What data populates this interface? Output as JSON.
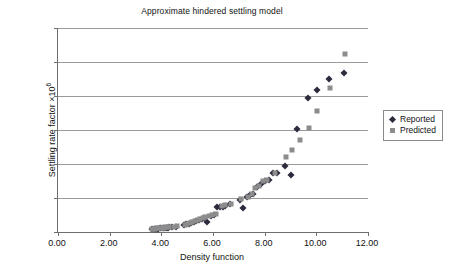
{
  "chart_data": {
    "type": "scatter",
    "title": "Approximate hindered settling model",
    "xlabel": "Density function",
    "ylabel": "Settling rate factor ×10⁶",
    "ylabel_base": "Settling rate factor ×10",
    "ylabel_exponent": "6",
    "xlim": [
      0.0,
      12.0
    ],
    "ylim": [
      0,
      12
    ],
    "xticks": [
      "0.00",
      "2.00",
      "4.00",
      "6.00",
      "8.00",
      "10.00",
      "12.00"
    ],
    "xtick_values": [
      0,
      2,
      4,
      6,
      8,
      10,
      12
    ],
    "yticks": [
      "0",
      "2",
      "4",
      "6",
      "8",
      "10",
      "12"
    ],
    "ytick_values": [
      0,
      2,
      4,
      6,
      8,
      10,
      12
    ],
    "grid": "horizontal",
    "legend_position": "right",
    "legend": [
      "Reported",
      "Predicted"
    ],
    "colors": {
      "reported": "#2b2b3d",
      "predicted": "#8c8c8c",
      "gridline": "#9a9a9a",
      "axis": "#6e6e6e"
    },
    "series": [
      {
        "name": "Reported",
        "marker": "diamond",
        "color": "#2b2b3d",
        "points": [
          [
            3.62,
            0.16
          ],
          [
            3.7,
            0.17
          ],
          [
            3.76,
            0.18
          ],
          [
            3.82,
            0.19
          ],
          [
            3.88,
            0.2
          ],
          [
            3.94,
            0.21
          ],
          [
            4.0,
            0.22
          ],
          [
            4.06,
            0.23
          ],
          [
            4.12,
            0.24
          ],
          [
            4.18,
            0.25
          ],
          [
            4.24,
            0.26
          ],
          [
            4.3,
            0.27
          ],
          [
            4.42,
            0.29
          ],
          [
            4.56,
            0.31
          ],
          [
            4.86,
            0.4
          ],
          [
            4.96,
            0.45
          ],
          [
            5.06,
            0.5
          ],
          [
            5.16,
            0.55
          ],
          [
            5.26,
            0.6
          ],
          [
            5.36,
            0.66
          ],
          [
            5.46,
            0.72
          ],
          [
            5.56,
            0.78
          ],
          [
            5.66,
            0.84
          ],
          [
            5.78,
            0.6
          ],
          [
            5.92,
            0.92
          ],
          [
            6.04,
            1.02
          ],
          [
            6.16,
            1.45
          ],
          [
            6.26,
            1.48
          ],
          [
            6.38,
            1.5
          ],
          [
            6.48,
            1.52
          ],
          [
            6.66,
            1.62
          ],
          [
            7.06,
            1.88
          ],
          [
            7.18,
            1.42
          ],
          [
            7.3,
            2.04
          ],
          [
            7.44,
            2.18
          ],
          [
            7.56,
            2.22
          ],
          [
            7.72,
            2.66
          ],
          [
            7.86,
            2.82
          ],
          [
            8.02,
            3.02
          ],
          [
            8.16,
            3.06
          ],
          [
            8.34,
            3.48
          ],
          [
            8.46,
            3.5
          ],
          [
            8.8,
            3.9
          ],
          [
            9.0,
            3.36
          ],
          [
            9.24,
            6.08
          ],
          [
            9.66,
            7.88
          ],
          [
            10.02,
            8.36
          ],
          [
            10.48,
            9.0
          ],
          [
            11.08,
            9.35
          ]
        ]
      },
      {
        "name": "Predicted",
        "marker": "square",
        "color": "#8c8c8c",
        "points": [
          [
            3.62,
            0.18
          ],
          [
            3.7,
            0.19
          ],
          [
            3.76,
            0.2
          ],
          [
            3.82,
            0.21
          ],
          [
            3.88,
            0.22
          ],
          [
            3.94,
            0.23
          ],
          [
            4.0,
            0.24
          ],
          [
            4.06,
            0.25
          ],
          [
            4.12,
            0.26
          ],
          [
            4.18,
            0.27
          ],
          [
            4.24,
            0.28
          ],
          [
            4.3,
            0.29
          ],
          [
            4.48,
            0.32
          ],
          [
            4.62,
            0.34
          ],
          [
            4.9,
            0.44
          ],
          [
            5.0,
            0.5
          ],
          [
            5.1,
            0.55
          ],
          [
            5.2,
            0.6
          ],
          [
            5.3,
            0.66
          ],
          [
            5.4,
            0.72
          ],
          [
            5.5,
            0.78
          ],
          [
            5.6,
            0.84
          ],
          [
            5.7,
            0.88
          ],
          [
            5.84,
            0.92
          ],
          [
            5.98,
            0.98
          ],
          [
            6.1,
            1.08
          ],
          [
            6.34,
            1.52
          ],
          [
            6.46,
            1.56
          ],
          [
            6.7,
            1.62
          ],
          [
            7.1,
            1.94
          ],
          [
            7.36,
            2.08
          ],
          [
            7.5,
            2.22
          ],
          [
            7.62,
            2.6
          ],
          [
            7.78,
            2.7
          ],
          [
            7.94,
            3.02
          ],
          [
            8.1,
            3.06
          ],
          [
            8.4,
            3.46
          ],
          [
            8.84,
            4.44
          ],
          [
            9.06,
            4.82
          ],
          [
            9.36,
            5.42
          ],
          [
            9.7,
            6.12
          ],
          [
            10.04,
            7.12
          ],
          [
            10.52,
            8.48
          ],
          [
            11.12,
            10.48
          ]
        ]
      }
    ]
  }
}
